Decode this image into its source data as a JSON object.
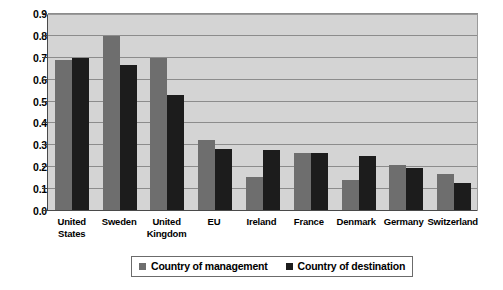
{
  "chart_data": {
    "type": "bar",
    "title": "",
    "xlabel": "",
    "ylabel": "",
    "ylim": [
      0.0,
      0.9
    ],
    "ytick_step": 0.1,
    "grid": true,
    "legend_position": "bottom",
    "categories": [
      "United States",
      "Sweden",
      "United Kingdom",
      "EU",
      "Ireland",
      "France",
      "Denmark",
      "Germany",
      "Switzerland"
    ],
    "yticks": [
      "0.0",
      "0.1",
      "0.2",
      "0.3",
      "0.4",
      "0.5",
      "0.6",
      "0.7",
      "0.8",
      "0.9"
    ],
    "series": [
      {
        "name": "Country of management",
        "color": "#6e6e6e",
        "values": [
          0.69,
          0.8,
          0.7,
          0.32,
          0.15,
          0.26,
          0.14,
          0.205,
          0.165
        ]
      },
      {
        "name": "Country of destination",
        "color": "#1c1c1c",
        "values": [
          0.7,
          0.665,
          0.53,
          0.28,
          0.275,
          0.26,
          0.25,
          0.195,
          0.125
        ]
      }
    ]
  },
  "style": {
    "plot_background": "#d4d4d4",
    "gridline_color": "#8c8c8c",
    "axis_color": "#4a4a4a",
    "page_background": "#ffffff"
  }
}
